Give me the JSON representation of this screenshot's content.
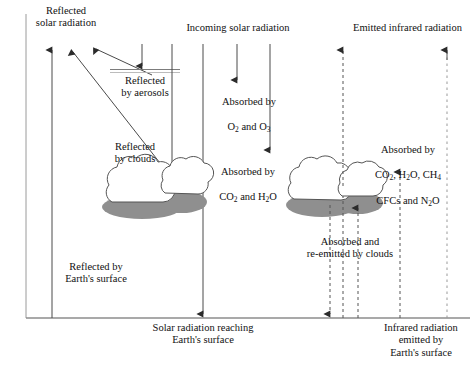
{
  "diagram": {
    "background": "#ffffff",
    "ink": "#333333",
    "cloud_fill": "#ffffff",
    "cloud_shadow": "#8a8a8a"
  },
  "labels": {
    "reflected_solar": "Reflected\nsolar radiation",
    "incoming_solar": "Incoming solar radiation",
    "emitted_infrared": "Emitted infrared radiation",
    "reflected_aerosols": "Reflected\nby aerosols",
    "reflected_clouds": "Reflected\nby clouds",
    "absorbed_o2_o3_line1": "Absorbed by",
    "absorbed_o2_o3_line2": "O2 and O3",
    "absorbed_co2_h2o_line1": "Absorbed by",
    "absorbed_co2_h2o_line2": "CO2 and H2O",
    "absorbed_ghg_line1": "Absorbed by",
    "absorbed_ghg_line2": "CO2, H2O, CH4",
    "absorbed_ghg_line3": "CFCs and N2O",
    "reflected_surface": "Reflected by\nEarth's surface",
    "absorbed_reemitted_clouds": "Absorbed and\nre-emitted by clouds",
    "solar_reaching_surface": "Solar radiation reaching\nEarth's surface",
    "infrared_emitted_surface": "Infrared radiation\nemitted by\nEarth's surface"
  },
  "elements": {
    "aerosol_layer_name": "aerosol-layer",
    "ground_line_name": "earth-surface-line",
    "left_border_name": "left-boundary-line",
    "cloud_left_name": "cloud-cluster-left",
    "cloud_right_name": "cloud-cluster-right"
  },
  "arrows": {
    "reflected_solar_vertical": {
      "direction": "up",
      "style": "solid",
      "x": 52
    },
    "reflected_by_aerosols_diagonal": {
      "direction": "up-left",
      "style": "solid"
    },
    "reflected_by_clouds_diagonal": {
      "direction": "up-left",
      "style": "solid"
    },
    "incoming_to_aerosols": {
      "direction": "down",
      "style": "solid",
      "x": 142
    },
    "incoming_to_clouds": {
      "direction": "down",
      "style": "solid",
      "x": 172
    },
    "incoming_to_surface_left": {
      "direction": "down",
      "style": "solid",
      "x": 203
    },
    "incoming_absorbed_o2_o3": {
      "direction": "down",
      "style": "solid",
      "x": 237
    },
    "incoming_absorbed_co2_h2o": {
      "direction": "down",
      "style": "solid",
      "x": 270
    },
    "infrared_through_clouds": {
      "direction": "up",
      "style": "dashed",
      "x": 343
    },
    "infrared_from_clouds_down": {
      "direction": "down",
      "style": "dashed",
      "x": 330
    },
    "infrared_to_clouds_up": {
      "direction": "up",
      "style": "dashed",
      "x": 358
    },
    "infrared_absorbed_ghg": {
      "direction": "up",
      "style": "dashed",
      "x": 400
    },
    "infrared_to_space": {
      "direction": "up",
      "style": "dashed",
      "x": 447
    }
  }
}
